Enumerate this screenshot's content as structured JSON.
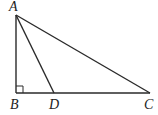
{
  "diagram": {
    "type": "geometry",
    "points": {
      "A": {
        "label": "A",
        "x": 16,
        "y": 15
      },
      "B": {
        "label": "B",
        "x": 16,
        "y": 93
      },
      "D": {
        "label": "D",
        "x": 54,
        "y": 93
      },
      "C": {
        "label": "C",
        "x": 150,
        "y": 93
      }
    },
    "segments": [
      "AB",
      "BC",
      "AC",
      "AD"
    ],
    "right_angle_at": "B"
  }
}
